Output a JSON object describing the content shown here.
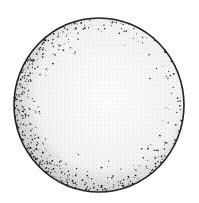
{
  "illustration": {
    "subject": "stippled sphere",
    "style": "pen-and-ink stipple drawing",
    "colors": {
      "background": "#ffffff",
      "ink": "#1a1a1a",
      "outline": "#222222"
    },
    "shape": {
      "cx": 99,
      "cy": 105,
      "rx": 85,
      "ry": 87
    }
  }
}
